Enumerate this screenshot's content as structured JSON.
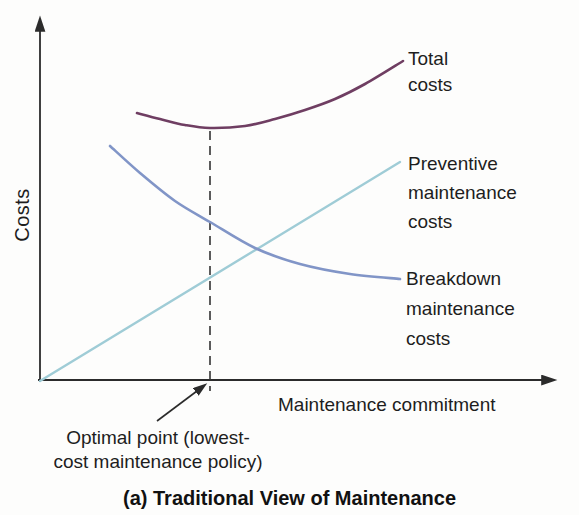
{
  "figure": {
    "caption": "(a) Traditional View of Maintenance",
    "axes": {
      "y_label": "Costs",
      "x_label": "Maintenance commitment",
      "color": "#2b2b2b"
    },
    "annotation": {
      "line1": "Optimal point (lowest-",
      "line2": "cost maintenance policy)"
    },
    "curve_labels": {
      "total": [
        "Total",
        "costs"
      ],
      "preventive": [
        "Preventive",
        "maintenance",
        "costs"
      ],
      "breakdown": [
        "Breakdown",
        "maintenance",
        "costs"
      ]
    }
  },
  "chart_data": {
    "type": "line",
    "title": "(a) Traditional View of Maintenance",
    "xlabel": "Maintenance commitment",
    "ylabel": "Costs",
    "axis_style": "conceptual diagram, no numeric ticks, no grid, arrowheads on both axes",
    "series": [
      {
        "name": "Total costs",
        "color": "#6f3e62",
        "trend": "U-shaped curve: falls to a minimum above the optimal point, then rises",
        "points_px": [
          [
            137,
            113
          ],
          [
            160,
            119
          ],
          [
            185,
            125
          ],
          [
            210,
            128
          ],
          [
            245,
            126
          ],
          [
            275,
            119
          ],
          [
            305,
            110
          ],
          [
            335,
            99
          ],
          [
            365,
            84
          ],
          [
            403,
            61
          ]
        ]
      },
      {
        "name": "Preventive maintenance costs",
        "color": "#9fccd6",
        "trend": "rises linearly from zero as maintenance commitment increases",
        "points_px": [
          [
            40,
            381
          ],
          [
            400,
            162
          ]
        ]
      },
      {
        "name": "Breakdown maintenance costs",
        "color": "#8195c7",
        "trend": "falls steeply then flattens as maintenance commitment increases",
        "points_px": [
          [
            110,
            146
          ],
          [
            140,
            173
          ],
          [
            175,
            201
          ],
          [
            210,
            222
          ],
          [
            255,
            248
          ],
          [
            300,
            264
          ],
          [
            350,
            274
          ],
          [
            400,
            279
          ]
        ]
      }
    ],
    "optimal_point": {
      "x_px": 210,
      "marker": "vertical dashed line from the total-cost minimum down past the x-axis",
      "label": "Optimal point (lowest-cost maintenance policy)"
    },
    "dashed_line_color": "#333333",
    "geometry_px": {
      "y_axis": [
        40,
        382,
        40,
        30
      ],
      "x_axis": [
        38,
        380,
        543,
        380
      ],
      "dashed_line": [
        210,
        131,
        210,
        391
      ],
      "pointer_arrow": [
        157,
        421,
        197,
        391
      ]
    }
  }
}
